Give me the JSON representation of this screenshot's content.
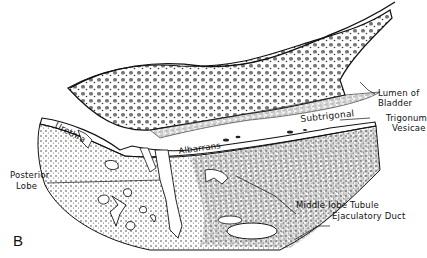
{
  "figure": {
    "panel_letter": "B",
    "colors": {
      "ink": "#111111",
      "background": "#ffffff",
      "stipple": "#555555"
    }
  },
  "labels": {
    "urethra": "Urethra",
    "albarrans": "Albarrans",
    "subtrigonal": "Subtrigonal",
    "lumen_of_bladder_line1": "Lumen of",
    "lumen_of_bladder_line2": "Bladder",
    "trigonum_vesicae_line1": "Trigonum",
    "trigonum_vesicae_line2": "Vesicae",
    "posterior_lobe_line1": "Posterior",
    "posterior_lobe_line2": "Lobe",
    "middle_lobe_tubule": "Middle lobe Tubule",
    "ejaculatory_duct": "Ejaculatory Duct"
  }
}
